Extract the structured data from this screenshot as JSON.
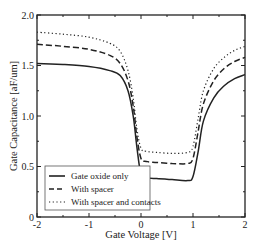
{
  "chart_data": {
    "type": "line",
    "title": "",
    "xlabel": "Gate Voltage [V]",
    "ylabel": "Gate Capacitance [aF/um]",
    "xlim": [
      -2,
      2
    ],
    "ylim": [
      0,
      2.0
    ],
    "xticks": [
      -2,
      -1,
      0,
      1,
      2
    ],
    "xtick_labels": [
      "-2",
      "-1",
      "0",
      "1",
      "2"
    ],
    "yticks": [
      0,
      0.5,
      1.0,
      1.5,
      2.0
    ],
    "ytick_labels": [
      "0",
      "0.5",
      "1.0",
      "1.5",
      "2.0"
    ],
    "grid": false,
    "legend_position": "lower left",
    "series": [
      {
        "name": "Gate oxide only",
        "style": "solid",
        "x": [
          -2,
          -1.5,
          -1,
          -0.6,
          -0.4,
          -0.25,
          -0.15,
          -0.08,
          0,
          0.1,
          0.3,
          0.6,
          0.9,
          1.0,
          1.1,
          1.2,
          1.4,
          1.6,
          1.8,
          2.0
        ],
        "y": [
          1.52,
          1.51,
          1.49,
          1.45,
          1.4,
          1.25,
          1.0,
          0.7,
          0.42,
          0.39,
          0.38,
          0.37,
          0.36,
          0.4,
          0.65,
          0.95,
          1.18,
          1.3,
          1.37,
          1.41
        ]
      },
      {
        "name": "With spacer",
        "style": "dashed",
        "x": [
          -2,
          -1.5,
          -1,
          -0.6,
          -0.4,
          -0.25,
          -0.15,
          -0.08,
          0,
          0.1,
          0.3,
          0.6,
          0.9,
          1.0,
          1.1,
          1.2,
          1.4,
          1.6,
          1.8,
          2.0
        ],
        "y": [
          1.71,
          1.69,
          1.66,
          1.6,
          1.52,
          1.35,
          1.1,
          0.8,
          0.58,
          0.55,
          0.54,
          0.53,
          0.53,
          0.58,
          0.85,
          1.12,
          1.35,
          1.47,
          1.54,
          1.58
        ],
        "dash": "6,3"
      },
      {
        "name": "With spacer and contacts",
        "style": "dotted",
        "x": [
          -2,
          -1.5,
          -1,
          -0.6,
          -0.4,
          -0.25,
          -0.15,
          -0.08,
          0,
          0.1,
          0.3,
          0.6,
          0.9,
          1.0,
          1.1,
          1.2,
          1.4,
          1.6,
          1.8,
          2.0
        ],
        "y": [
          1.83,
          1.81,
          1.78,
          1.72,
          1.64,
          1.45,
          1.18,
          0.88,
          0.68,
          0.65,
          0.64,
          0.63,
          0.64,
          0.7,
          0.98,
          1.25,
          1.47,
          1.58,
          1.65,
          1.69
        ],
        "dash": "1.2,2.5"
      }
    ]
  }
}
